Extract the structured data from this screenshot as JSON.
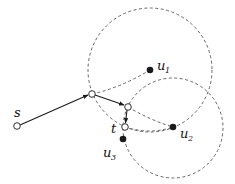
{
  "diagram": {
    "colors": {
      "ink": "#1a1a1a",
      "dashed": "#555555",
      "background": "#ffffff"
    },
    "labels": {
      "s": "s",
      "t": "t",
      "u1": "u",
      "u1_sub": "1",
      "u2": "u",
      "u2_sub": "2",
      "u3": "u",
      "u3_sub": "3"
    },
    "nodes": [
      {
        "id": "s",
        "type": "hollow",
        "x": 17,
        "y": 126
      },
      {
        "id": "a",
        "type": "hollow",
        "x": 92,
        "y": 94
      },
      {
        "id": "b",
        "type": "hollow",
        "x": 128,
        "y": 107
      },
      {
        "id": "t",
        "type": "hollow",
        "x": 125,
        "y": 127
      },
      {
        "id": "u1",
        "type": "filled",
        "x": 150,
        "y": 70
      },
      {
        "id": "u2",
        "type": "filled",
        "x": 173,
        "y": 127
      },
      {
        "id": "u3",
        "type": "filled",
        "x": 123,
        "y": 139
      }
    ],
    "circles": [
      {
        "center": "u1",
        "cx": 150,
        "cy": 70,
        "r": 62
      },
      {
        "center": "u2",
        "cx": 173,
        "cy": 128,
        "r": 50
      }
    ],
    "arrows": [
      {
        "from": "s",
        "to": "a"
      },
      {
        "from": "a",
        "to": "b"
      },
      {
        "from": "b",
        "to": "t"
      }
    ],
    "dashed_edges": [
      {
        "from": "a",
        "to": "u1"
      },
      {
        "from": "b",
        "to": "u2"
      },
      {
        "from": "t",
        "to": "u2"
      }
    ]
  }
}
